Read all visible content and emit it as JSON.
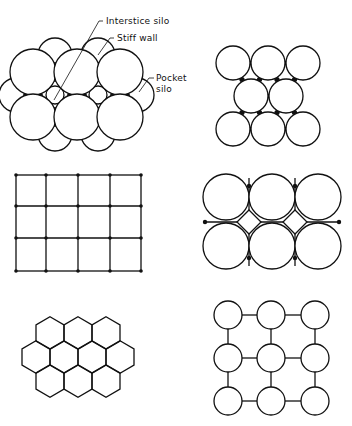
{
  "figure": {
    "caption": "",
    "panels": [
      {
        "id": "circular-silos-with-interstice-and-pocket-silos",
        "position": "top-left",
        "labels": [
          {
            "text": "Interstice silo",
            "x": 106,
            "y": 24
          },
          {
            "text": "Stiff wall",
            "x": 117,
            "y": 41
          },
          {
            "text": "Pocket",
            "x": 156,
            "y": 81
          },
          {
            "text": "silo",
            "x": 156,
            "y": 92
          }
        ],
        "circles": [
          {
            "cx": 33,
            "cy": 72,
            "r": 23
          },
          {
            "cx": 77,
            "cy": 72,
            "r": 23
          },
          {
            "cx": 120,
            "cy": 72,
            "r": 23
          },
          {
            "cx": 33,
            "cy": 117,
            "r": 23
          },
          {
            "cx": 77,
            "cy": 117,
            "r": 23
          },
          {
            "cx": 120,
            "cy": 117,
            "r": 23
          }
        ]
      },
      {
        "id": "staggered-circular-silos",
        "position": "top-right",
        "circles": [
          {
            "cx": 233,
            "cy": 63,
            "r": 17
          },
          {
            "cx": 268,
            "cy": 63,
            "r": 17
          },
          {
            "cx": 303,
            "cy": 63,
            "r": 17
          },
          {
            "cx": 251,
            "cy": 96,
            "r": 17
          },
          {
            "cx": 286,
            "cy": 96,
            "r": 17
          },
          {
            "cx": 233,
            "cy": 129,
            "r": 17
          },
          {
            "cx": 268,
            "cy": 129,
            "r": 17
          },
          {
            "cx": 303,
            "cy": 129,
            "r": 17
          }
        ]
      },
      {
        "id": "rectangular-bins",
        "position": "middle-left",
        "grid": {
          "xs": [
            16,
            46,
            78,
            110,
            141
          ],
          "ys": [
            175,
            206,
            238,
            271
          ]
        }
      },
      {
        "id": "circular-silos-with-diamond-interstices",
        "position": "middle-right",
        "circles": [
          {
            "cx": 226,
            "cy": 197,
            "r": 23
          },
          {
            "cx": 272,
            "cy": 197,
            "r": 23
          },
          {
            "cx": 318,
            "cy": 197,
            "r": 23
          },
          {
            "cx": 226,
            "cy": 246,
            "r": 23
          },
          {
            "cx": 272,
            "cy": 246,
            "r": 23
          },
          {
            "cx": 318,
            "cy": 246,
            "r": 23
          }
        ],
        "diamonds": [
          {
            "cx": 249,
            "cy": 222,
            "h": 12
          },
          {
            "cx": 295,
            "cy": 222,
            "h": 12
          }
        ]
      },
      {
        "id": "hexagonal-bins",
        "position": "bottom-left",
        "hexagons": {
          "R": 16.2,
          "rows": [
            {
              "cy": 333,
              "cxs": [
                50,
                78,
                106
              ]
            },
            {
              "cy": 357,
              "cxs": [
                36,
                64,
                92,
                120
              ]
            },
            {
              "cy": 381,
              "cxs": [
                50,
                78,
                106
              ]
            }
          ]
        }
      },
      {
        "id": "spaced-circular-silos-with-connecting-walls",
        "position": "bottom-right",
        "lattice": {
          "xs": [
            228,
            271,
            315
          ],
          "ys": [
            315,
            358,
            401
          ],
          "r": 14
        }
      }
    ]
  }
}
